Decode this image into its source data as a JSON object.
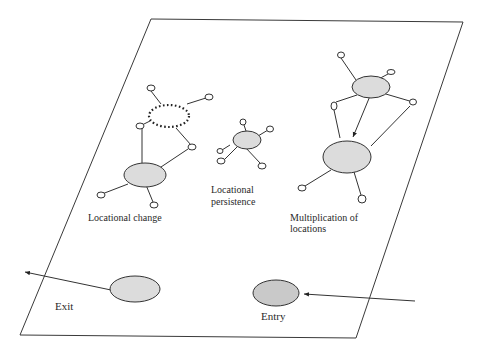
{
  "diagram": {
    "type": "location-network-diagram",
    "plane": {
      "shape": "parallelogram",
      "stroke": "#3a3a3a"
    },
    "node_fill": "#dcdcdc",
    "groups": [
      {
        "id": "locational-change",
        "label_lines": [
          "Locational change"
        ]
      },
      {
        "id": "locational-persistence",
        "label_lines": [
          "Locational",
          "persistence"
        ]
      },
      {
        "id": "multiplication-of-locations",
        "label_lines": [
          "Multiplication of",
          "locations"
        ]
      }
    ],
    "exit": {
      "label": "Exit"
    },
    "entry": {
      "label": "Entry"
    }
  }
}
